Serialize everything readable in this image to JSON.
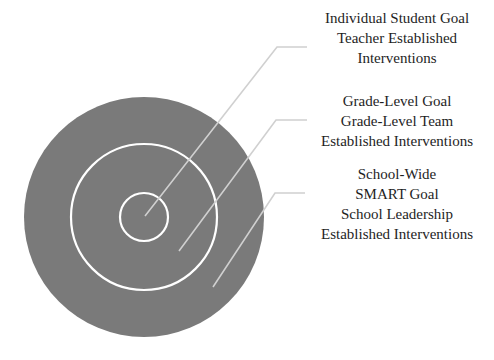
{
  "diagram": {
    "type": "concentric-target",
    "colors": {
      "target_fill": "#7a7a7a",
      "ring_stroke": "#ffffff",
      "leader_line": "#d0d0d0",
      "text": "#1e1e1e",
      "background": "#ffffff"
    },
    "levels": [
      {
        "id": "individual",
        "lines": [
          "Individual Student Goal",
          "Teacher Established",
          "Interventions"
        ]
      },
      {
        "id": "grade-level",
        "lines": [
          "Grade-Level Goal",
          "Grade-Level Team",
          "Established Interventions"
        ]
      },
      {
        "id": "school-wide",
        "lines": [
          "School-Wide",
          "SMART Goal",
          "School Leadership",
          "Established Interventions"
        ]
      }
    ]
  }
}
